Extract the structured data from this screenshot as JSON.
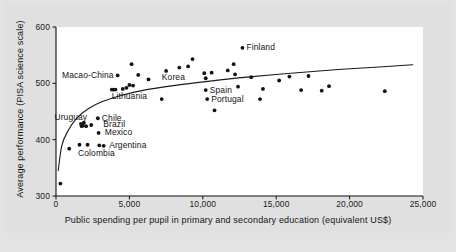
{
  "chart_data": {
    "type": "scatter",
    "title": "",
    "xlabel": "Public spending per pupil in primary and secondary education (equivalent US$)",
    "ylabel": "Average performance (PISA science scale)",
    "xlim": [
      0,
      25000
    ],
    "ylim": [
      300,
      600
    ],
    "xticks": [
      "0",
      "5,000",
      "10,000",
      "15,000",
      "20,000",
      "25,000"
    ],
    "xtick_values": [
      0,
      5000,
      10000,
      15000,
      20000,
      25000
    ],
    "yticks": [
      "300",
      "400",
      "500",
      "600"
    ],
    "ytick_values": [
      300,
      400,
      500,
      600
    ],
    "grid": false,
    "legend": "none",
    "marker_color": "#111111",
    "trendline_color": "#1a1a1a",
    "points": [
      {
        "x": 300,
        "y": 322,
        "label": ""
      },
      {
        "x": 900,
        "y": 384,
        "label": ""
      },
      {
        "x": 1600,
        "y": 391,
        "label": ""
      },
      {
        "x": 1700,
        "y": 428,
        "label": ""
      },
      {
        "x": 1750,
        "y": 424,
        "label": ""
      },
      {
        "x": 1820,
        "y": 425,
        "label": ""
      },
      {
        "x": 1900,
        "y": 430,
        "label": ""
      },
      {
        "x": 2050,
        "y": 424,
        "label": ""
      },
      {
        "x": 2150,
        "y": 391,
        "label": ""
      },
      {
        "x": 2400,
        "y": 426,
        "label": ""
      },
      {
        "x": 2850,
        "y": 438,
        "label": "Chile"
      },
      {
        "x": 2900,
        "y": 412,
        "label": "Mexico"
      },
      {
        "x": 2950,
        "y": 390,
        "label": ""
      },
      {
        "x": 3250,
        "y": 389,
        "label": "Argentina"
      },
      {
        "x": 3800,
        "y": 489,
        "label": ""
      },
      {
        "x": 3900,
        "y": 489,
        "label": ""
      },
      {
        "x": 4050,
        "y": 489,
        "label": ""
      },
      {
        "x": 4200,
        "y": 514,
        "label": "Macao-China"
      },
      {
        "x": 4550,
        "y": 490,
        "label": ""
      },
      {
        "x": 4800,
        "y": 492,
        "label": ""
      },
      {
        "x": 5000,
        "y": 497,
        "label": ""
      },
      {
        "x": 5150,
        "y": 534,
        "label": ""
      },
      {
        "x": 5250,
        "y": 496,
        "label": ""
      },
      {
        "x": 5600,
        "y": 515,
        "label": ""
      },
      {
        "x": 6300,
        "y": 507,
        "label": ""
      },
      {
        "x": 7200,
        "y": 472,
        "label": ""
      },
      {
        "x": 7500,
        "y": 522,
        "label": ""
      },
      {
        "x": 8400,
        "y": 528,
        "label": ""
      },
      {
        "x": 9000,
        "y": 530,
        "label": ""
      },
      {
        "x": 9300,
        "y": 543,
        "label": ""
      },
      {
        "x": 10100,
        "y": 518,
        "label": ""
      },
      {
        "x": 10200,
        "y": 509,
        "label": ""
      },
      {
        "x": 10200,
        "y": 488,
        "label": "Spain"
      },
      {
        "x": 10300,
        "y": 472,
        "label": "Portugal"
      },
      {
        "x": 10600,
        "y": 519,
        "label": ""
      },
      {
        "x": 10800,
        "y": 452,
        "label": ""
      },
      {
        "x": 11700,
        "y": 523,
        "label": ""
      },
      {
        "x": 12100,
        "y": 534,
        "label": ""
      },
      {
        "x": 12200,
        "y": 516,
        "label": ""
      },
      {
        "x": 12400,
        "y": 494,
        "label": ""
      },
      {
        "x": 12700,
        "y": 563,
        "label": "Finland"
      },
      {
        "x": 13300,
        "y": 511,
        "label": ""
      },
      {
        "x": 13900,
        "y": 472,
        "label": ""
      },
      {
        "x": 14100,
        "y": 490,
        "label": ""
      },
      {
        "x": 15200,
        "y": 505,
        "label": ""
      },
      {
        "x": 15900,
        "y": 512,
        "label": ""
      },
      {
        "x": 16700,
        "y": 488,
        "label": ""
      },
      {
        "x": 17200,
        "y": 513,
        "label": ""
      },
      {
        "x": 18100,
        "y": 487,
        "label": ""
      },
      {
        "x": 18600,
        "y": 495,
        "label": ""
      },
      {
        "x": 22400,
        "y": 486,
        "label": ""
      }
    ],
    "annotations": [
      {
        "text": "Finland",
        "x": 12700,
        "y": 563,
        "anchor": "left"
      },
      {
        "text": "Macao-China",
        "x": 4200,
        "y": 514,
        "anchor": "right"
      },
      {
        "text": "Korea",
        "x": 8000,
        "y": 511,
        "anchor": "center"
      },
      {
        "text": "Lithuania",
        "x": 5000,
        "y": 476,
        "anchor": "center"
      },
      {
        "text": "Spain",
        "x": 10200,
        "y": 488,
        "anchor": "left"
      },
      {
        "text": "Portugal",
        "x": 10300,
        "y": 472,
        "anchor": "left"
      },
      {
        "text": "Uruguay",
        "x": 2400,
        "y": 440,
        "anchor": "right"
      },
      {
        "text": "Chile",
        "x": 2850,
        "y": 438,
        "anchor": "left"
      },
      {
        "text": "Brazil",
        "x": 2950,
        "y": 427,
        "anchor": "left"
      },
      {
        "text": "Mexico",
        "x": 3050,
        "y": 412,
        "anchor": "left"
      },
      {
        "text": "Argentina",
        "x": 3350,
        "y": 390,
        "anchor": "left"
      },
      {
        "text": "Colombia",
        "x": 2750,
        "y": 376,
        "anchor": "center"
      }
    ],
    "trendline": {
      "type": "logarithmic",
      "description": "fitted curve rising steeply then flattening",
      "points": [
        {
          "x": 150,
          "y": 345
        },
        {
          "x": 400,
          "y": 390
        },
        {
          "x": 800,
          "y": 415
        },
        {
          "x": 1400,
          "y": 438
        },
        {
          "x": 2200,
          "y": 455
        },
        {
          "x": 3200,
          "y": 468
        },
        {
          "x": 4500,
          "y": 479
        },
        {
          "x": 6000,
          "y": 488
        },
        {
          "x": 8000,
          "y": 496
        },
        {
          "x": 10500,
          "y": 504
        },
        {
          "x": 13000,
          "y": 511
        },
        {
          "x": 16000,
          "y": 518
        },
        {
          "x": 19000,
          "y": 524
        },
        {
          "x": 22000,
          "y": 529
        },
        {
          "x": 24300,
          "y": 533
        }
      ]
    }
  }
}
